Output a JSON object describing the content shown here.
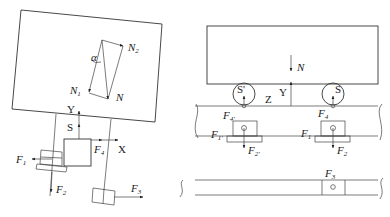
{
  "figure": {
    "left_panel": {
      "force_triangle": {
        "vectors": [
          "N",
          "N1",
          "N2"
        ],
        "angle": "α",
        "labels": {
          "N": {
            "main": "N",
            "sub": ""
          },
          "N1": {
            "main": "N",
            "sub": "1"
          },
          "N2": {
            "main": "N",
            "sub": "2"
          },
          "alpha": {
            "main": "α",
            "sub": ""
          }
        }
      },
      "axes": {
        "Y": "Y",
        "X": "X",
        "S": "S"
      },
      "forces": {
        "F1": {
          "main": "F",
          "sub": "1"
        },
        "F2": {
          "main": "F",
          "sub": "2"
        },
        "F3": {
          "main": "F",
          "sub": "3"
        },
        "F4": {
          "main": "F",
          "sub": "4"
        }
      }
    },
    "right_panel": {
      "labels": {
        "N": {
          "main": "N",
          "sub": ""
        },
        "Y": "Y",
        "Z": "Z",
        "S": "S",
        "S_prime": "S'",
        "F4_prime": {
          "main": "F",
          "sub": "4'"
        },
        "F4": {
          "main": "F",
          "sub": "4"
        },
        "F1_prime": {
          "main": "F",
          "sub": "1'"
        },
        "F1": {
          "main": "F",
          "sub": "1"
        },
        "F2_prime": {
          "main": "F",
          "sub": "2'"
        },
        "F2": {
          "main": "F",
          "sub": "2"
        },
        "F3": {
          "main": "F",
          "sub": "3"
        }
      }
    }
  }
}
